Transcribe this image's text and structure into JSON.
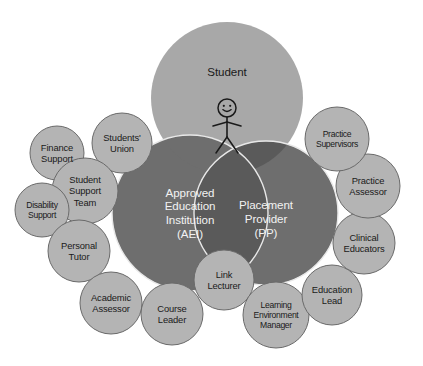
{
  "diagram": {
    "colors": {
      "background": "#ffffff",
      "student_fill": "#a8a8a8",
      "partner_fill": "#6e6e6e",
      "overlap_fill": "#5a5a5a",
      "satellite_fill": "#b4b4b4",
      "satellite_stroke": "#6a6a6a",
      "big_stroke": "#e8e8e8",
      "dark_text": "#1a1a1a",
      "light_text": "#f2f2f2",
      "figure_stroke": "#1a1a1a"
    },
    "primary_nodes": [
      {
        "id": "student",
        "label": "Student",
        "cx": 227,
        "cy": 98,
        "r": 76,
        "fill_key": "student_fill",
        "text_color": "dark",
        "label_dy": -26,
        "has_figure": true
      },
      {
        "id": "aei",
        "label": "Approved\nEducation\nInstitution\n(AEI)",
        "cx": 190,
        "cy": 213,
        "r": 78,
        "fill_key": "partner_fill",
        "text_color": "light",
        "label_dy": 0,
        "has_figure": false
      },
      {
        "id": "pp",
        "label": "Placement\nProvider\n(PP)",
        "cx": 266,
        "cy": 213,
        "r": 72,
        "fill_key": "partner_fill",
        "text_color": "light",
        "label_dy": 6,
        "has_figure": false
      }
    ],
    "satellite_nodes": [
      {
        "id": "finance-support",
        "label": "Finance\nSupport",
        "cx": 57,
        "cy": 153,
        "r": 27,
        "tight": false
      },
      {
        "id": "students-union",
        "label": "Students'\nUnion",
        "cx": 122,
        "cy": 143,
        "r": 30,
        "tight": false
      },
      {
        "id": "student-support-team",
        "label": "Student\nSupport\nTeam",
        "cx": 85,
        "cy": 191,
        "r": 33,
        "tight": false
      },
      {
        "id": "disability-support",
        "label": "Disability\nSupport",
        "cx": 42,
        "cy": 210,
        "r": 27,
        "tight": true
      },
      {
        "id": "personal-tutor",
        "label": "Personal\nTutor",
        "cx": 79,
        "cy": 251,
        "r": 31,
        "tight": false
      },
      {
        "id": "academic-assessor",
        "label": "Academic\nAssessor",
        "cx": 111,
        "cy": 303,
        "r": 31,
        "tight": false
      },
      {
        "id": "course-leader",
        "label": "Course\nLeader",
        "cx": 172,
        "cy": 314,
        "r": 31,
        "tight": false
      },
      {
        "id": "link-lecturer",
        "label": "Link\nLecturer",
        "cx": 224,
        "cy": 280,
        "r": 30,
        "tight": false
      },
      {
        "id": "learning-env-manager",
        "label": "Learning\nEnvironment\nManager",
        "cx": 276,
        "cy": 315,
        "r": 33,
        "tight": true
      },
      {
        "id": "education-lead",
        "label": "Education\nLead",
        "cx": 332,
        "cy": 295,
        "r": 30,
        "tight": false
      },
      {
        "id": "clinical-educators",
        "label": "Clinical\nEducators",
        "cx": 364,
        "cy": 243,
        "r": 31,
        "tight": false
      },
      {
        "id": "practice-assessor",
        "label": "Practice\nAssessor",
        "cx": 368,
        "cy": 186,
        "r": 32,
        "tight": false
      },
      {
        "id": "practice-supervisors",
        "label": "Practice\nSupervisors",
        "cx": 337,
        "cy": 139,
        "r": 32,
        "tight": true
      }
    ],
    "stick_figure": {
      "id": "student-stick-figure",
      "head_cx": 227,
      "head_cy": 108,
      "head_r": 9,
      "body_top_y": 117,
      "body_bottom_y": 137,
      "arm_y": 122,
      "arm_half_width": 14,
      "leg_spread": 11,
      "leg_bottom_y": 153,
      "face": {
        "eye_dx": 3.2,
        "eye_dy": -2.2,
        "eye_r": 1.1,
        "smile_r": 4.2
      }
    }
  }
}
